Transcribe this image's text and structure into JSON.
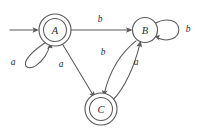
{
  "figure": {
    "kind": "finite-state-automaton-diagram",
    "background_color": "#ffffff",
    "stroke_color": "#5a5a5a",
    "text_color": "#2b2b2b"
  },
  "states": [
    {
      "id": "A",
      "label": "A",
      "accepting": true,
      "start": true,
      "cx": 55,
      "cy": 30,
      "r_outer": 16,
      "r_inner": 11.5
    },
    {
      "id": "B",
      "label": "B",
      "accepting": false,
      "start": false,
      "cx": 145,
      "cy": 30,
      "r_outer": 12.5,
      "r_inner": 0
    },
    {
      "id": "C",
      "label": "C",
      "accepting": true,
      "start": false,
      "cx": 101,
      "cy": 109,
      "r_outer": 16,
      "r_inner": 11.5
    }
  ],
  "transitions": [
    {
      "id": "A-self",
      "from": "A",
      "to": "A",
      "symbol": "a",
      "label_x": 13,
      "label_y": 62,
      "shape": "self-loop-lower-left"
    },
    {
      "id": "A-to-B",
      "from": "A",
      "to": "B",
      "symbol": "b",
      "label_x": 100,
      "label_y": 19,
      "shape": "straight-horizontal"
    },
    {
      "id": "A-to-C",
      "from": "A",
      "to": "C",
      "symbol": "a",
      "label_x": 61,
      "label_y": 64,
      "shape": "straight-diagonal"
    },
    {
      "id": "B-to-C",
      "from": "B",
      "to": "C",
      "symbol": "b",
      "label_x": 103,
      "label_y": 52,
      "shape": "curve-left"
    },
    {
      "id": "C-to-B",
      "from": "C",
      "to": "B",
      "symbol": "a",
      "label_x": 136,
      "label_y": 62,
      "shape": "curve-right"
    },
    {
      "id": "B-self",
      "from": "B",
      "to": "B",
      "symbol": "b",
      "label_x": 188,
      "label_y": 29,
      "shape": "self-loop-right"
    }
  ],
  "start_arrow": {
    "name": "start-arrow",
    "x1": 10,
    "y1": 30,
    "x2": 38,
    "y2": 30
  }
}
